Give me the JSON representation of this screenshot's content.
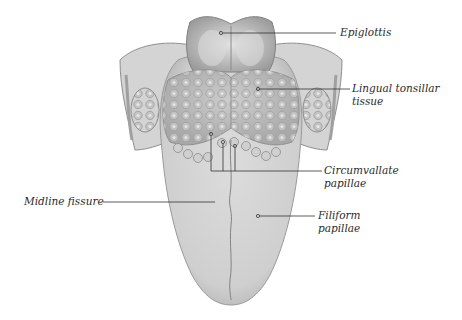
{
  "diagram": {
    "colors": {
      "tongue_fill": "#d6d6d6",
      "tongue_shade": "#b8b8b8",
      "outline": "#8a8a8a",
      "leader_line": "#333333",
      "label_text": "#2b2b2b",
      "background": "#ffffff"
    },
    "labels": [
      {
        "id": "epiglottis",
        "line1": "Epiglottis",
        "line2": ""
      },
      {
        "id": "lingual-tonsillar-tissue",
        "line1": "Lingual tonsillar",
        "line2": "tissue"
      },
      {
        "id": "circumvallate-papillae",
        "line1": "Circumvallate",
        "line2": "papillae"
      },
      {
        "id": "midline-fissure",
        "line1": "Midline fissure",
        "line2": ""
      },
      {
        "id": "filiform-papillae",
        "line1": "Filiform",
        "line2": "papillae"
      }
    ]
  }
}
